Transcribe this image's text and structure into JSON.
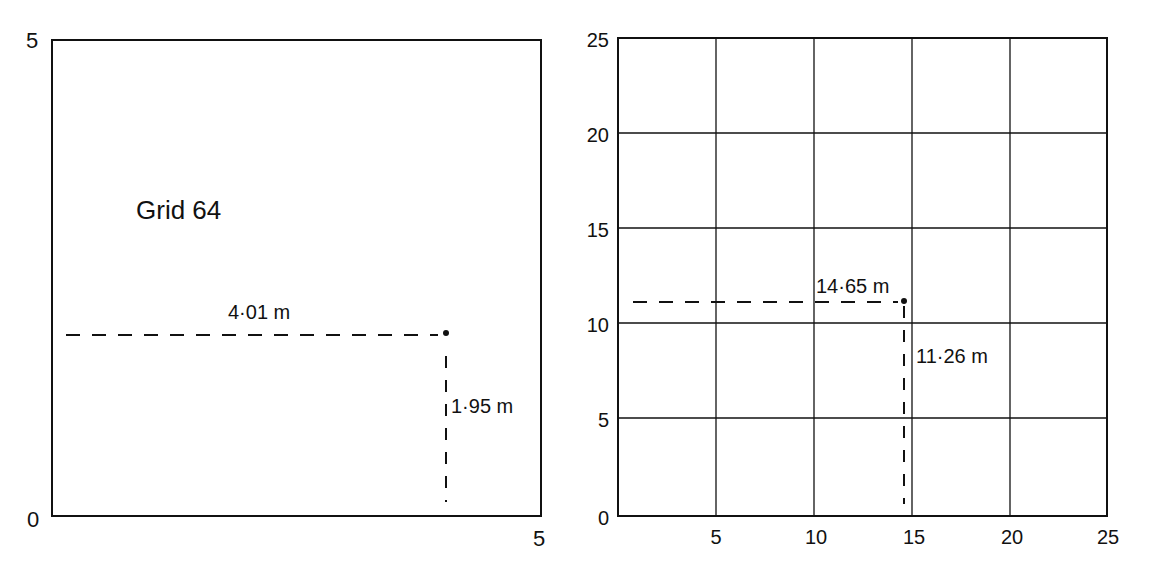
{
  "left_panel": {
    "title": "Grid 64",
    "axis": {
      "x_min": 0,
      "x_max": 5,
      "y_min": 0,
      "y_max": 5,
      "y_top_label": "5",
      "origin_label": "0",
      "x_right_label": "5"
    },
    "point": {
      "x": 4.01,
      "y": 1.95
    },
    "x_measure_label": "4·01 m",
    "y_measure_label": "1·95 m"
  },
  "right_panel": {
    "axis": {
      "x_min": 0,
      "x_max": 25,
      "y_min": 0,
      "y_max": 25,
      "x_tick_labels": [
        "5",
        "10",
        "15",
        "20",
        "25"
      ],
      "y_tick_labels": [
        "0",
        "5",
        "10",
        "15",
        "20",
        "25"
      ],
      "grid_step": 5
    },
    "point": {
      "x": 14.65,
      "y": 11.26
    },
    "x_measure_label": "14·65 m",
    "y_measure_label": "11·26 m"
  },
  "colors": {
    "ink": "#111111",
    "background": "#ffffff"
  }
}
